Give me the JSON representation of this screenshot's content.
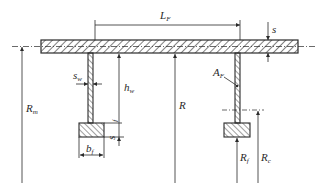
{
  "diagram": {
    "title": "",
    "type": "cross-section",
    "colors": {
      "line": "#2a2a2a",
      "background": "#ffffff",
      "hatch": "#2a2a2a"
    },
    "labels": {
      "L_F": {
        "main": "L",
        "sub": "F"
      },
      "s": {
        "main": "s",
        "sub": ""
      },
      "s_w": {
        "main": "s",
        "sub": "w"
      },
      "h_w": {
        "main": "h",
        "sub": "w"
      },
      "A_F": {
        "main": "A",
        "sub": "F"
      },
      "R_m": {
        "main": "R",
        "sub": "m"
      },
      "R": {
        "main": "R",
        "sub": ""
      },
      "s_f": {
        "main": "s",
        "sub": "f"
      },
      "b_f": {
        "main": "b",
        "sub": "f"
      },
      "R_f": {
        "main": "R",
        "sub": "f"
      },
      "R_c": {
        "main": "R",
        "sub": "c"
      }
    },
    "components": [
      "shell-plate",
      "left-stiffener-web",
      "left-stiffener-flange",
      "right-stiffener-web",
      "right-stiffener-flange",
      "shell-midplane-centerline",
      "stiffener-centroid-line"
    ],
    "dimensions": [
      "stiffener-spacing L_F",
      "shell-thickness s",
      "web-thickness s_w",
      "web-height h_w",
      "stiffener-area A_F",
      "mean-radius R_m",
      "inner-radius R",
      "flange-thickness s_f",
      "flange-width b_f",
      "flange-radius R_f",
      "centroid-radius R_c"
    ]
  }
}
